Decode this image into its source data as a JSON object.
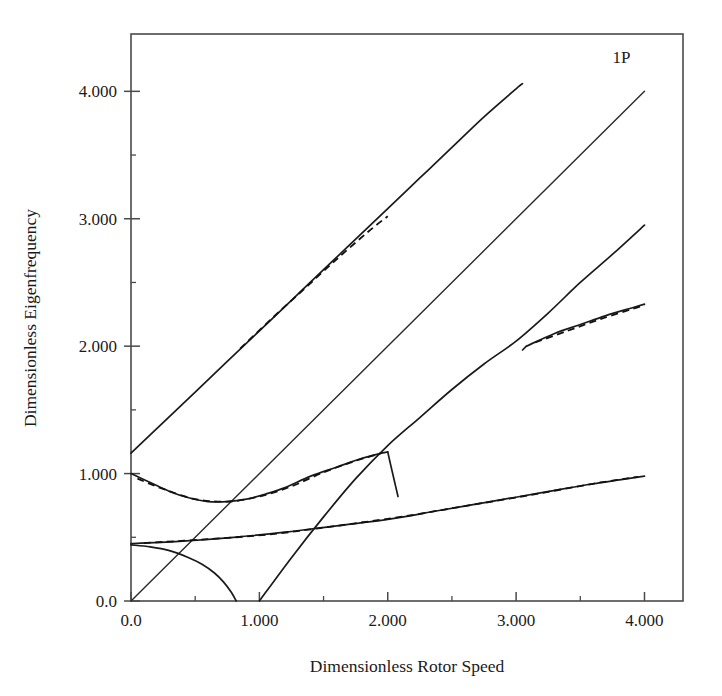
{
  "chart_data": {
    "type": "line",
    "title": "",
    "xlabel": "Dimensionless Rotor Speed",
    "ylabel": "Dimensionless Eigenfrequency",
    "xlim": [
      0.0,
      4.3
    ],
    "ylim": [
      0.0,
      4.45
    ],
    "grid": false,
    "legend_position": "none",
    "xticks": [
      0.0,
      1.0,
      2.0,
      3.0,
      4.0
    ],
    "xticklabels": [
      "0.0",
      "1.000",
      "2.000",
      "3.000",
      "4.000"
    ],
    "xminorticks": [
      0.5,
      1.5,
      2.5,
      3.5
    ],
    "yticks": [
      0.0,
      1.0,
      2.0,
      3.0,
      4.0
    ],
    "yticklabels": [
      "0.0",
      "1.000",
      "2.000",
      "3.000",
      "4.000"
    ],
    "yminorticks": [
      0.5,
      1.5,
      2.5,
      3.5
    ],
    "annotations": [
      {
        "text": "1P",
        "x": 3.82,
        "y": 4.22
      }
    ],
    "series": [
      {
        "name": "1P excitation line",
        "style": "solid",
        "x": [
          0.0,
          4.0
        ],
        "y": [
          0.0,
          4.0
        ]
      },
      {
        "name": "second flap regressive-to-progressive",
        "style": "solid",
        "x": [
          0.0,
          0.25,
          0.5,
          0.75,
          1.0,
          1.25,
          1.5,
          1.75,
          2.0,
          2.25,
          2.5,
          2.75,
          3.0,
          3.05
        ],
        "y": [
          1.16,
          1.4,
          1.64,
          1.88,
          2.12,
          2.36,
          2.6,
          2.84,
          3.08,
          3.32,
          3.56,
          3.8,
          4.02,
          4.06
        ]
      },
      {
        "name": "second flap regressive dashed overlay",
        "style": "dashed",
        "x": [
          0.85,
          1.1,
          1.35,
          1.6,
          1.85,
          2.0
        ],
        "y": [
          1.98,
          2.22,
          2.45,
          2.68,
          2.9,
          3.02
        ]
      },
      {
        "name": "first flap progressive steep",
        "style": "solid",
        "x": [
          1.0,
          1.25,
          1.5,
          1.75,
          2.0,
          2.25,
          2.5,
          2.75,
          3.0,
          3.25,
          3.5,
          3.75,
          4.0
        ],
        "y": [
          0.0,
          0.34,
          0.66,
          0.96,
          1.22,
          1.44,
          1.66,
          1.86,
          2.04,
          2.26,
          2.5,
          2.72,
          2.95
        ]
      },
      {
        "name": "first lag regressive dip branch",
        "style": "solid",
        "x": [
          0.0,
          0.15,
          0.3,
          0.45,
          0.6,
          0.75,
          0.9,
          1.05,
          1.2,
          1.4,
          1.6,
          1.8,
          1.95,
          2.0
        ],
        "y": [
          1.0,
          0.93,
          0.86,
          0.81,
          0.78,
          0.78,
          0.8,
          0.84,
          0.89,
          0.98,
          1.05,
          1.12,
          1.16,
          1.17
        ]
      },
      {
        "name": "first lag regressive dashed overlay",
        "style": "dashed",
        "x": [
          0.05,
          0.25,
          0.5,
          0.75,
          1.0,
          1.25,
          1.5,
          1.75,
          1.95
        ],
        "y": [
          0.96,
          0.88,
          0.8,
          0.78,
          0.82,
          0.9,
          1.01,
          1.1,
          1.16
        ]
      },
      {
        "name": "descent from peak to branch",
        "style": "solid",
        "x": [
          2.0,
          2.02,
          2.05,
          2.08
        ],
        "y": [
          1.17,
          1.08,
          0.95,
          0.82
        ]
      },
      {
        "name": "first lag progressive shallow",
        "style": "solid",
        "x": [
          0.0,
          0.4,
          0.8,
          1.2,
          1.6,
          2.0,
          2.4,
          2.8,
          3.2,
          3.6,
          4.0
        ],
        "y": [
          0.45,
          0.47,
          0.5,
          0.54,
          0.59,
          0.64,
          0.71,
          0.78,
          0.85,
          0.92,
          0.98
        ]
      },
      {
        "name": "first lag progressive dashed overlay",
        "style": "dashed",
        "x": [
          0.1,
          0.6,
          1.1,
          1.6,
          2.1,
          2.6,
          3.1,
          3.6,
          3.95
        ],
        "y": [
          0.455,
          0.485,
          0.525,
          0.59,
          0.66,
          0.745,
          0.83,
          0.92,
          0.975
        ]
      },
      {
        "name": "torsion regressive to zero",
        "style": "solid",
        "x": [
          0.0,
          0.15,
          0.3,
          0.45,
          0.55,
          0.65,
          0.72,
          0.78,
          0.82
        ],
        "y": [
          0.44,
          0.425,
          0.395,
          0.34,
          0.29,
          0.22,
          0.15,
          0.07,
          0.0
        ]
      },
      {
        "name": "branch upper arm after bifurcation",
        "style": "solid",
        "x": [
          3.08,
          3.3,
          3.5,
          3.7,
          3.9,
          4.0
        ],
        "y": [
          2.0,
          2.1,
          2.17,
          2.24,
          2.3,
          2.33
        ]
      },
      {
        "name": "branch upper arm dashed overlay",
        "style": "dashed",
        "x": [
          3.15,
          3.4,
          3.65,
          3.9,
          4.0
        ],
        "y": [
          2.03,
          2.12,
          2.21,
          2.29,
          2.32
        ]
      },
      {
        "name": "branch segment below bifurcation",
        "style": "solid",
        "x": [
          3.05,
          3.08
        ],
        "y": [
          1.97,
          2.0
        ]
      }
    ]
  },
  "axes": {
    "x_title": "Dimensionless Rotor Speed",
    "y_title": "Dimensionless Eigenfrequency"
  }
}
